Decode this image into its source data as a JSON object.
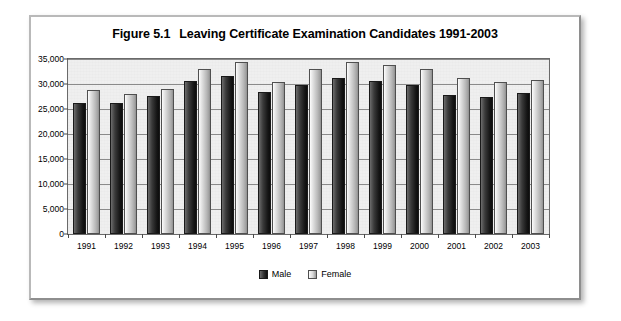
{
  "figure": {
    "number": "Figure 5.1",
    "title": "Leaving Certificate Examination Candidates 1991-2003"
  },
  "legend": {
    "male_label": "Male",
    "female_label": "Female",
    "male_color": "#262626",
    "female_color": "#d2d2d2",
    "position": "bottom-center"
  },
  "chart_data": {
    "type": "bar",
    "xlabel": "",
    "ylabel": "",
    "ylim": [
      0,
      35000
    ],
    "ytick_labels": [
      "0",
      "5,000",
      "10,000",
      "15,000",
      "20,000",
      "25,000",
      "30,000",
      "35,000"
    ],
    "ytick_values": [
      0,
      5000,
      10000,
      15000,
      20000,
      25000,
      30000,
      35000
    ],
    "grid": true,
    "grid_axis": "y",
    "legend_position": "bottom-center",
    "categories": [
      "1991",
      "1992",
      "1993",
      "1994",
      "1995",
      "1996",
      "1997",
      "1998",
      "1999",
      "2000",
      "2001",
      "2002",
      "2003"
    ],
    "series": [
      {
        "name": "Male",
        "color": "#262626",
        "values": [
          26300,
          26300,
          27600,
          30600,
          31700,
          28400,
          29800,
          31200,
          30700,
          29900,
          27900,
          27400,
          28300
        ]
      },
      {
        "name": "Female",
        "color": "#d2d2d2",
        "values": [
          28900,
          28100,
          29000,
          33000,
          34400,
          30400,
          33000,
          34400,
          33900,
          33100,
          31200,
          30400,
          30800
        ]
      }
    ]
  }
}
